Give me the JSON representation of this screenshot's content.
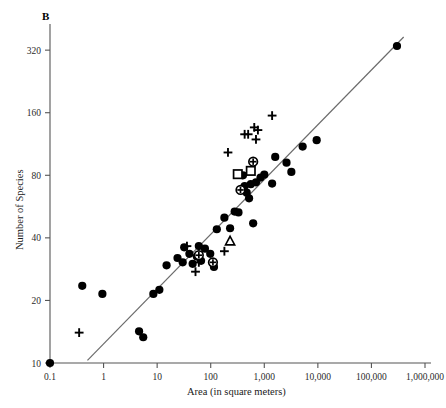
{
  "figure": {
    "panel_label": "B",
    "background_color": "#ffffff",
    "marker_color": "#000000",
    "line_color": "#6b6b6b",
    "axis_color": "#555555"
  },
  "chart_data": {
    "type": "scatter",
    "title": "B",
    "xlabel": "Area (in square meters)",
    "ylabel": "Number of Species",
    "xscale": "log",
    "yscale": "log",
    "xlim": [
      0.1,
      1000000
    ],
    "ylim": [
      10,
      400
    ],
    "grid": false,
    "legend": "none",
    "xticks": [
      0.1,
      1,
      10,
      100,
      1000,
      10000,
      100000,
      1000000
    ],
    "xticklabels": [
      "0.1",
      "1",
      "10",
      "100",
      "1,000",
      "10,000",
      "100,000",
      "1,000,000"
    ],
    "yticks": [
      10,
      20,
      40,
      80,
      160,
      320
    ],
    "yticklabels": [
      "10",
      "20",
      "40",
      "80",
      "160",
      "320"
    ],
    "trendline": {
      "label": "regression line",
      "x": [
        0.5,
        400000
      ],
      "y": [
        10.3,
        370
      ]
    },
    "series": [
      {
        "name": "filled-circle",
        "marker": "circle",
        "points": [
          [
            0.1,
            10.0
          ],
          [
            0.4,
            23.5
          ],
          [
            0.95,
            21.5
          ],
          [
            4.6,
            14.2
          ],
          [
            5.5,
            13.3
          ],
          [
            8.5,
            21.5
          ],
          [
            11.0,
            22.5
          ],
          [
            15.0,
            29.5
          ],
          [
            24.0,
            32.0
          ],
          [
            30.0,
            30.5
          ],
          [
            32.0,
            36.0
          ],
          [
            40.0,
            33.5
          ],
          [
            46.0,
            30.0
          ],
          [
            55.0,
            32.5
          ],
          [
            60.0,
            36.5
          ],
          [
            66.0,
            31.0
          ],
          [
            78.0,
            35.5
          ],
          [
            98.0,
            33.5
          ],
          [
            115.0,
            29.0
          ],
          [
            130.0,
            44.0
          ],
          [
            180.0,
            50.0
          ],
          [
            230.0,
            44.5
          ],
          [
            280.0,
            53.5
          ],
          [
            330.0,
            53.0
          ],
          [
            400.0,
            80.0
          ],
          [
            430.0,
            71.0
          ],
          [
            470.0,
            66.0
          ],
          [
            520.0,
            62.0
          ],
          [
            560.0,
            72.5
          ],
          [
            620.0,
            47.0
          ],
          [
            700.0,
            74.0
          ],
          [
            850.0,
            78.0
          ],
          [
            1000.0,
            80.5
          ],
          [
            1400.0,
            73.0
          ],
          [
            1600.0,
            98.0
          ],
          [
            2600.0,
            92.0
          ],
          [
            3200.0,
            83.0
          ],
          [
            5200.0,
            110.0
          ],
          [
            9500.0,
            118.0
          ],
          [
            300000.0,
            335.0
          ]
        ]
      },
      {
        "name": "plus",
        "marker": "plus",
        "points": [
          [
            0.35,
            14.0
          ],
          [
            36.0,
            36.5
          ],
          [
            52.0,
            27.5
          ],
          [
            60.0,
            30.5
          ],
          [
            180.0,
            34.5
          ],
          [
            210.0,
            103.0
          ],
          [
            430.0,
            126.0
          ],
          [
            500.0,
            126.0
          ],
          [
            650.0,
            136.0
          ],
          [
            700.0,
            119.0
          ],
          [
            760.0,
            132.0
          ],
          [
            1400.0,
            155.0
          ]
        ]
      },
      {
        "name": "open-square",
        "marker": "square",
        "points": [
          [
            320.0,
            81.0
          ],
          [
            560.0,
            84.0
          ]
        ]
      },
      {
        "name": "circled-plus",
        "marker": "circle-plus",
        "points": [
          [
            60.0,
            33.0
          ],
          [
            110.0,
            30.5
          ],
          [
            360.0,
            68.0
          ],
          [
            620.0,
            93.0
          ]
        ]
      },
      {
        "name": "open-triangle",
        "marker": "triangle",
        "points": [
          [
            230.0,
            38.5
          ]
        ]
      }
    ]
  }
}
